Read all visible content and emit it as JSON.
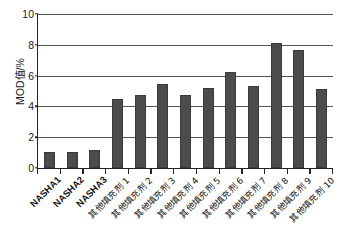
{
  "chart_data": {
    "type": "bar",
    "title": "",
    "subtitle": "",
    "xlabel": "",
    "ylabel": "MOD值/%",
    "ylim": [
      0,
      10
    ],
    "yticks": [
      0,
      2,
      4,
      6,
      8,
      10
    ],
    "ytick_labels": [
      "0",
      "2",
      "4",
      "6",
      "8",
      "10"
    ],
    "grid": true,
    "grid_axis": "y",
    "legend": false,
    "legend_position": "none",
    "bar_color": "#4c4c4c",
    "categories": [
      "NASHA1",
      "NASHA2",
      "NASHA3",
      "其他填充剂 1",
      "其他填充剂 2",
      "其他填充剂 3",
      "其他填充剂 4",
      "其他填充剂 5",
      "其他填充剂 6",
      "其他填充剂 7",
      "其他填充剂 8",
      "其他填充剂 9",
      "其他填充剂 10"
    ],
    "category_scripts": [
      "latin",
      "latin",
      "latin",
      "cjk",
      "cjk",
      "cjk",
      "cjk",
      "cjk",
      "cjk",
      "cjk",
      "cjk",
      "cjk",
      "cjk"
    ],
    "values": [
      1.05,
      1.05,
      1.2,
      4.5,
      4.75,
      5.45,
      4.75,
      5.2,
      6.25,
      5.3,
      8.1,
      7.65,
      5.1
    ]
  }
}
